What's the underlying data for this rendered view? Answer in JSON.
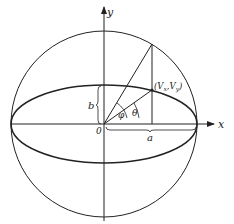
{
  "diagram": {
    "axes": {
      "x_label": "x",
      "y_label": "y",
      "origin_label": "0"
    },
    "labels": {
      "point": "(V",
      "point_sub_x": "x",
      "point_mid": ",V",
      "point_sub_y": "y",
      "point_end": ")",
      "semi_minor": "b",
      "semi_major": "a",
      "angle_phi": "φ",
      "angle_theta": "θ"
    },
    "colors": {
      "stroke": "#222222",
      "background": "#ffffff"
    }
  }
}
